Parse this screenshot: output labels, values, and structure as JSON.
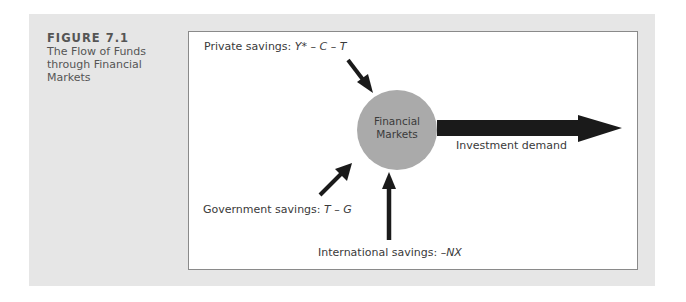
{
  "figure": {
    "label": "FIGURE 7.1",
    "title": "The Flow of Funds through Financial Markets"
  },
  "diagram": {
    "center_node": {
      "line1": "Financial",
      "line2": "Markets",
      "fill": "#aaaaaa"
    },
    "inflows": [
      {
        "label": "Private savings:",
        "formula": "Y* – C – T",
        "direction": "from upper-left"
      },
      {
        "label": "Government savings:",
        "formula": "T – G",
        "direction": "from lower-left"
      },
      {
        "label": "International savings:",
        "formula": "–NX",
        "direction": "from below"
      }
    ],
    "outflow": {
      "label": "Investment demand",
      "direction": "to right"
    },
    "colors": {
      "panel": "#e6e6e6",
      "arrow": "#1a1a1a",
      "text": "#3a3a3a",
      "figure_label": "#555555"
    }
  }
}
